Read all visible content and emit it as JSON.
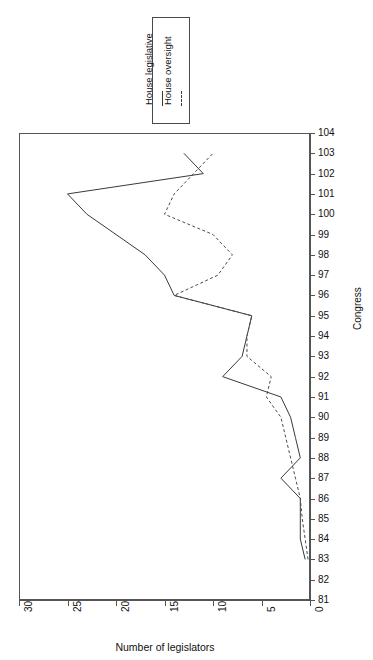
{
  "chart_data": {
    "type": "line",
    "title": "",
    "xlabel": "Number of legislators",
    "ylabel": "Congress",
    "orientation": "horizontal",
    "xlim": [
      30,
      0
    ],
    "xlim_note": "x axis reversed: 30 at left, 0 at right",
    "ylim": [
      81,
      104
    ],
    "grid": false,
    "legend_position": "above-plot",
    "xticks": [
      30,
      25,
      20,
      15,
      10,
      5,
      0
    ],
    "yticks": [
      81,
      82,
      83,
      84,
      85,
      86,
      87,
      88,
      89,
      90,
      91,
      92,
      93,
      94,
      95,
      96,
      97,
      98,
      99,
      100,
      101,
      102,
      103,
      104
    ],
    "categories": [
      83,
      84,
      85,
      86,
      87,
      88,
      89,
      90,
      91,
      92,
      93,
      94,
      95,
      96,
      97,
      98,
      99,
      100,
      101,
      102,
      103
    ],
    "series": [
      {
        "name": "House legislative",
        "style": "solid",
        "color": "#3a3a3a",
        "values": [
          0.5,
          1,
          1,
          1,
          3,
          1,
          1.5,
          2,
          3,
          9,
          7,
          6.5,
          6,
          14,
          15,
          17,
          20,
          23,
          25,
          11,
          13
        ]
      },
      {
        "name": "House oversight",
        "style": "dashed",
        "color": "#4a4a4a",
        "values": [
          0.2,
          0.5,
          0.8,
          1,
          1.5,
          2,
          2.5,
          3,
          4.5,
          4,
          6.5,
          6.5,
          6,
          14,
          9.5,
          8,
          10,
          15,
          14,
          12,
          10
        ]
      }
    ]
  },
  "legend": {
    "entries": [
      {
        "label": "House legislative",
        "style": "solid"
      },
      {
        "label": "House oversight",
        "style": "dashed"
      }
    ]
  },
  "axes": {
    "y": {
      "title": "Congress",
      "labels": [
        "81",
        "82",
        "83",
        "84",
        "85",
        "86",
        "87",
        "88",
        "89",
        "90",
        "91",
        "92",
        "93",
        "94",
        "95",
        "96",
        "97",
        "98",
        "99",
        "100",
        "101",
        "102",
        "103",
        "104"
      ]
    },
    "x": {
      "title": "Number of legislators",
      "labels": [
        "30",
        "25",
        "20",
        "15",
        "10",
        "5",
        "0"
      ]
    }
  }
}
